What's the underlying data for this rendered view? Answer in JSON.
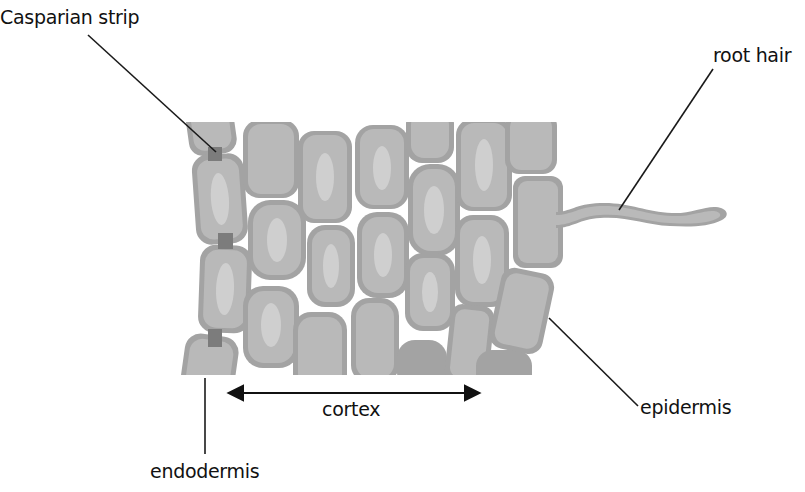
{
  "diagram": {
    "labels": {
      "casparian_strip": "Casparian strip",
      "root_hair": "root hair",
      "cortex": "cortex",
      "epidermis": "epidermis",
      "endodermis": "endodermis"
    },
    "colors": {
      "cell_wall": "#a3a3a3",
      "cytoplasm": "#b9b9b9",
      "vacuole": "#cfcfcf",
      "casparian_strip": "#7c7c7c",
      "leader_line": "#1a1a1a"
    }
  }
}
